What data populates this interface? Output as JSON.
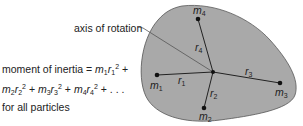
{
  "diagram": {
    "axis_label": "axis of rotation",
    "formula": {
      "prefix": "moment of inertia = ",
      "terms": [
        "m1r1^2",
        "m2r2^2",
        "m3r3^2",
        "m4r4^2"
      ],
      "suffix": "+ . . .",
      "line3": "for all particles"
    },
    "particles": [
      {
        "mass": "m",
        "sub": "1",
        "radius": "r",
        "rsub": "1"
      },
      {
        "mass": "m",
        "sub": "2",
        "radius": "r",
        "rsub": "2"
      },
      {
        "mass": "m",
        "sub": "3",
        "radius": "r",
        "rsub": "3"
      },
      {
        "mass": "m",
        "sub": "4",
        "radius": "r",
        "rsub": "4"
      }
    ],
    "colors": {
      "body_fill": "#a9a9a9",
      "line": "#222222"
    }
  }
}
